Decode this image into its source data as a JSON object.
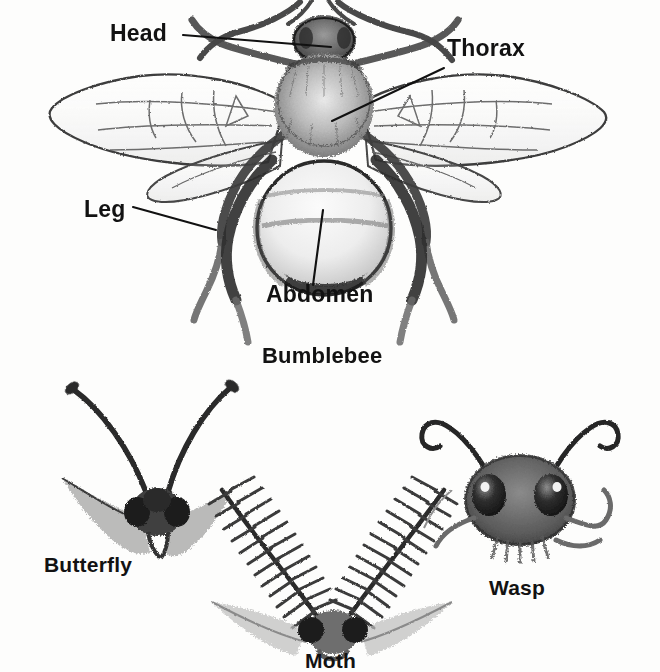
{
  "page": {
    "kind": "insect-anatomy-diagram",
    "background_color": "#fdfdfc",
    "ink_color": "#2b2b2b",
    "label_color": "#121212",
    "width": 660,
    "height": 672
  },
  "figures": [
    {
      "id": "bumblebee",
      "caption": "Bumblebee",
      "description": "Top-down sketch of a bumblebee with spread wings and six legs",
      "callouts": [
        {
          "id": "head",
          "label": "Head",
          "target": "head of the bumblebee"
        },
        {
          "id": "thorax",
          "label": "Thorax",
          "target": "thorax of the bumblebee"
        },
        {
          "id": "leg",
          "label": "Leg",
          "target": "left middle leg of the bumblebee"
        },
        {
          "id": "abdomen",
          "label": "Abdomen",
          "target": "abdomen of the bumblebee"
        }
      ]
    },
    {
      "id": "butterfly",
      "caption": "Butterfly",
      "description": "Head of a butterfly with long clubbed antennae"
    },
    {
      "id": "moth",
      "caption": "Moth",
      "description": "Head of a moth with feathery plumose antennae"
    },
    {
      "id": "wasp",
      "caption": "Wasp",
      "description": "Head of a wasp with curled antennae and large compound eyes"
    }
  ],
  "labels": {
    "head": "Head",
    "thorax": "Thorax",
    "leg": "Leg",
    "abdomen": "Abdomen",
    "bumblebee": "Bumblebee",
    "butterfly": "Butterfly",
    "moth": "Moth",
    "wasp": "Wasp"
  }
}
